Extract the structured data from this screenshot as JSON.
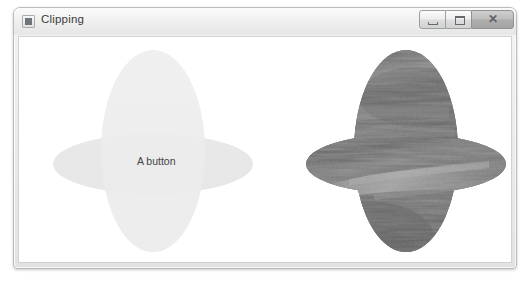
{
  "window": {
    "title": "Clipping",
    "icon": "app-window-icon",
    "controls": [
      {
        "name": "minimize",
        "glyph": "—"
      },
      {
        "name": "maximize",
        "glyph": "□"
      },
      {
        "name": "close",
        "glyph": "✕"
      }
    ]
  },
  "content": {
    "button": {
      "label": "A button",
      "fill_color": "#ededed",
      "band_color": "#e4e4e4",
      "text_color": "#444444"
    },
    "image": {
      "name": "grayscale-landscape-photo",
      "description": "Grayscale nature photograph of vegetation and a river",
      "dark_tone": "#4a4a4a",
      "mid_tone": "#767676",
      "light_tone": "#c9c9c9"
    },
    "clip_shape": {
      "type": "union-of-ellipses",
      "vertical_ellipse": {
        "cx": 134,
        "cy": 114,
        "rx": 52,
        "ry": 101
      },
      "horizontal_ellipse": {
        "cx": 134,
        "cy": 127,
        "rx": 100,
        "ry": 30
      }
    },
    "shapes": [
      {
        "name": "clipped-button",
        "offset_x": 0
      },
      {
        "name": "clipped-image",
        "offset_x": 253
      }
    ]
  },
  "colors": {
    "frame_border": "#b9bcbe",
    "titlebar_top": "#fbfbfb",
    "titlebar_bottom": "#e6e6e6",
    "client_background": "#ffffff"
  }
}
